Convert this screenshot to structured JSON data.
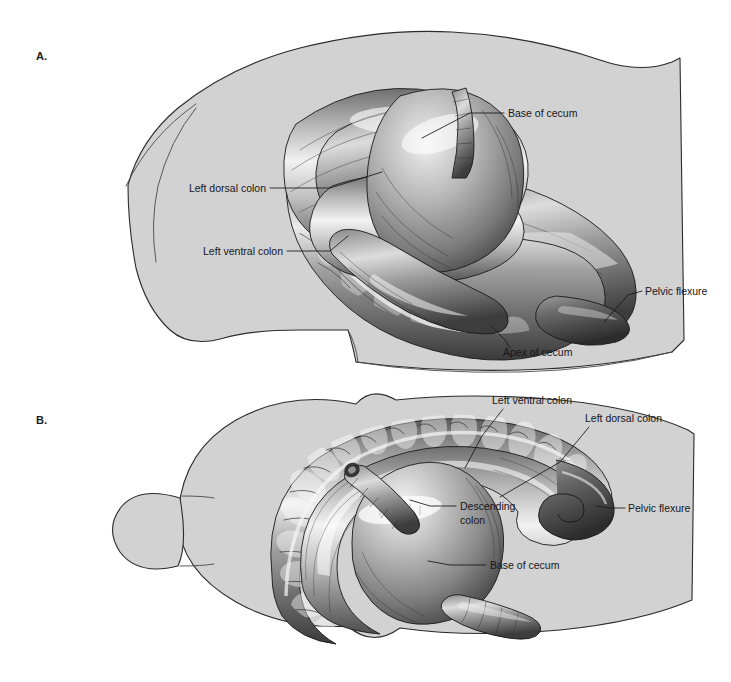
{
  "figure": {
    "background_color": "#ffffff",
    "body_fill_color": "#d2d2d2",
    "body_outline_color": "#2b2b2b",
    "label_text_color": "#15161a",
    "leader_line_color": "#15161a"
  },
  "panels": [
    {
      "id": "panel-a",
      "letter": "A.",
      "view": "lateral view of equine abdomen",
      "letter_position": {
        "x": 36,
        "y": 60
      },
      "annotations": [
        {
          "id": "a-base-of-cecum",
          "label": "Base of cecum",
          "text_x": 508,
          "text_y": 117,
          "anchor": "start",
          "leader": [
            [
              504,
              113
            ],
            [
              470,
              113
            ],
            [
              422,
              138
            ]
          ]
        },
        {
          "id": "a-left-dorsal-colon",
          "label": "Left dorsal colon",
          "text_x": 266,
          "text_y": 192,
          "anchor": "end",
          "leader": [
            [
              270,
              188
            ],
            [
              330,
              188
            ],
            [
              382,
              172
            ]
          ]
        },
        {
          "id": "a-left-ventral-colon",
          "label": "Left ventral colon",
          "text_x": 283,
          "text_y": 255,
          "anchor": "end",
          "leader": [
            [
              287,
              251
            ],
            [
              330,
              251
            ],
            [
              348,
              236
            ]
          ]
        },
        {
          "id": "a-pelvic-flexure",
          "label": "Pelvic flexure",
          "text_x": 645,
          "text_y": 295,
          "anchor": "start",
          "leader": [
            [
              642,
              291
            ],
            [
              628,
              295
            ],
            [
              604,
              322
            ]
          ]
        },
        {
          "id": "a-apex-of-cecum",
          "label": "Apex of cecum",
          "text_x": 503,
          "text_y": 356,
          "anchor": "start",
          "leader": [
            [
              510,
              348
            ],
            [
              505,
              340
            ],
            [
              490,
              325
            ]
          ]
        }
      ]
    },
    {
      "id": "panel-b",
      "letter": "B.",
      "view": "ventral view of equine abdomen",
      "letter_position": {
        "x": 36,
        "y": 424
      },
      "annotations": [
        {
          "id": "b-left-ventral-colon",
          "label": "Left ventral colon",
          "text_x": 492,
          "text_y": 404,
          "anchor": "start",
          "leader": [
            [
              503,
              409
            ],
            [
              482,
              436
            ],
            [
              465,
              468
            ]
          ]
        },
        {
          "id": "b-left-dorsal-colon",
          "label": "Left dorsal colon",
          "text_x": 585,
          "text_y": 422,
          "anchor": "start",
          "leader": [
            [
              589,
              427
            ],
            [
              560,
              462
            ],
            [
              500,
              497
            ]
          ]
        },
        {
          "id": "b-descending-colon",
          "label": "Descending colon",
          "label_line_1": "Descending",
          "label_line_2": "colon",
          "text_x": 460,
          "text_y": 510,
          "anchor": "start",
          "leader": [
            [
              456,
              506
            ],
            [
              430,
              506
            ],
            [
              410,
              500
            ]
          ]
        },
        {
          "id": "b-pelvic-flexure",
          "label": "Pelvic flexure",
          "text_x": 628,
          "text_y": 512,
          "anchor": "start",
          "leader": [
            [
              625,
              508
            ],
            [
              610,
              508
            ],
            [
              596,
              506
            ]
          ]
        },
        {
          "id": "b-base-of-cecum",
          "label": "Base of cecum",
          "text_x": 490,
          "text_y": 569,
          "anchor": "start",
          "leader": [
            [
              486,
              565
            ],
            [
              450,
              565
            ],
            [
              428,
              561
            ]
          ]
        }
      ]
    }
  ]
}
